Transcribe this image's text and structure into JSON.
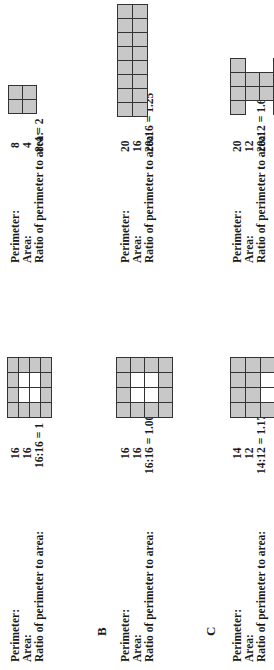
{
  "rows": [
    {
      "label": "",
      "left": {
        "perimeter_label": "Perimeter:",
        "area_label": "Area:",
        "ratio_label": "Ratio of perimeter to area:",
        "perimeter": "16",
        "area": "16",
        "ratio": "16:16 = 1",
        "shape": "4x4 square with 2x2 hole"
      },
      "right": {
        "perimeter_label": "Perimeter:",
        "area_label": "Area:",
        "ratio_label": "Ratio of perimeter to area:",
        "perimeter": "8",
        "area": "4",
        "ratio": "8:4 = 2",
        "shape": "2x2 square"
      }
    },
    {
      "label": "B",
      "left": {
        "perimeter_label": "Perimeter:",
        "area_label": "Area:",
        "ratio_label": "Ratio of perimeter to area:",
        "perimeter": "16",
        "area": "16",
        "ratio": "16:16 = 1.00",
        "shape": "4x4 square with 2x2 hole"
      },
      "right": {
        "perimeter_label": "Perimeter:",
        "area_label": "Area:",
        "ratio_label": "Ratio of perimeter to area:",
        "perimeter": "20",
        "area": "16",
        "ratio": "20:16 = 1.25",
        "shape": "2x8 rectangle"
      }
    },
    {
      "label": "C",
      "left": {
        "perimeter_label": "Perimeter:",
        "area_label": "Area:",
        "ratio_label": "Ratio of perimeter to area:",
        "perimeter": "14",
        "area": "12",
        "ratio": "14:12 = 1.17",
        "shape": "grid with 2-cell hole"
      },
      "right": {
        "perimeter_label": "Perimeter:",
        "area_label": "Area:",
        "ratio_label": "Ratio of perimeter to area:",
        "perimeter": "20",
        "area": "12",
        "ratio": "20:12 = 1.67",
        "shape": "I-beam shape"
      }
    }
  ],
  "colors": {
    "cell_fill": "#c8c8c8",
    "grid_line": "#333333",
    "background": "#ffffff"
  }
}
